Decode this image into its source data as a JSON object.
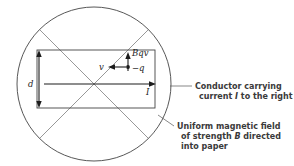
{
  "figure": {
    "type": "physics-diagram",
    "title": "",
    "background_color": "#ffffff",
    "line_color": "#444444",
    "text_color": "#3a3a3a",
    "symbol_color": "#1c1c1c"
  },
  "symbols": {
    "force_label": "Bqv",
    "velocity_label": "v",
    "charge_label": "−q",
    "current_label": "I",
    "width_label": "d"
  },
  "annotations": {
    "conductor": {
      "line1": "Conductor carrying",
      "line2_prefix": "current ",
      "line2_symbol": "I",
      "line2_suffix": " to the right"
    },
    "field": {
      "line1": "Uniform magnetic field",
      "line2_prefix": "of strength ",
      "line2_symbol": "B",
      "line2_suffix": " directed",
      "line3": "into paper"
    }
  },
  "geometry": {
    "circle": {
      "cx": 94,
      "cy": 84,
      "r": 77
    },
    "rectangle": {
      "x": 37,
      "y": 50,
      "width": 118,
      "height": 58
    },
    "current_arrow": {
      "x1": 44,
      "y1": 84,
      "x2": 155,
      "y2": 84
    },
    "dimension_arrow": {
      "x": 39,
      "y1": 51,
      "y2": 107
    },
    "charge_point": {
      "cx": 128,
      "cy": 67
    },
    "force_arrow": {
      "x": 128,
      "y1": 71,
      "y2": 53
    },
    "velocity_arrow": {
      "x1": 127,
      "y1": 67,
      "x2": 109,
      "y2": 67
    }
  }
}
